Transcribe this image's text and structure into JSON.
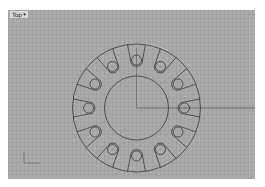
{
  "viewport": {
    "title": "Top",
    "dropdown_icon": "▾",
    "background": "#ababab",
    "grid_color": "#969696"
  },
  "drawing": {
    "center": [
      128.5,
      98
    ],
    "outer_radius": 64,
    "inner_radius": 32,
    "slot_count": 12,
    "slot_start_angle_deg": 0,
    "slot_hole_radius_distance": 48,
    "slot_hole_radius": 5,
    "slot_outer_half_width": 9,
    "line_color": "#3a3a3a",
    "axis_line_color": "#5a5a5a",
    "highlight_color": "#e8e8e8"
  },
  "axis_widget": {
    "origin": [
      16,
      153
    ],
    "x_length": 16,
    "y_length": 11,
    "labels": {
      "x": "x",
      "y": "y"
    }
  }
}
